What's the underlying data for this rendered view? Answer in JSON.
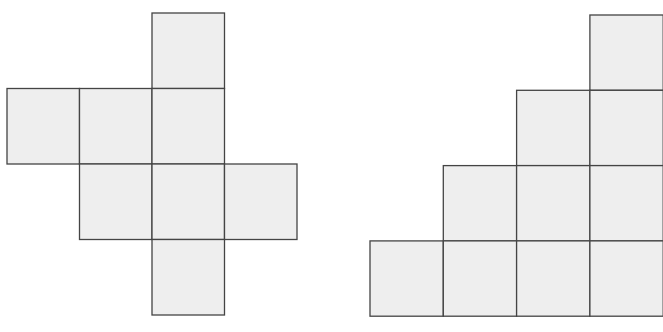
{
  "colors": {
    "cell_fill": "#eeeeee",
    "cell_stroke": "#444444",
    "background": "#ffffff"
  },
  "figures": [
    {
      "name": "cross-net-figure",
      "origin_x": 7,
      "origin_y": 13,
      "cell_w": 72.5,
      "cell_h": 75.5,
      "cells": [
        {
          "row": 0,
          "col": 2
        },
        {
          "row": 1,
          "col": 0
        },
        {
          "row": 1,
          "col": 1
        },
        {
          "row": 1,
          "col": 2
        },
        {
          "row": 2,
          "col": 1
        },
        {
          "row": 2,
          "col": 2
        },
        {
          "row": 2,
          "col": 3
        },
        {
          "row": 3,
          "col": 2
        }
      ]
    },
    {
      "name": "staircase-figure",
      "origin_x": 370,
      "origin_y": 15,
      "cell_w": 73.3,
      "cell_h": 75.3,
      "cells": [
        {
          "row": 0,
          "col": 3
        },
        {
          "row": 1,
          "col": 2
        },
        {
          "row": 1,
          "col": 3
        },
        {
          "row": 2,
          "col": 1
        },
        {
          "row": 2,
          "col": 2
        },
        {
          "row": 2,
          "col": 3
        },
        {
          "row": 3,
          "col": 0
        },
        {
          "row": 3,
          "col": 1
        },
        {
          "row": 3,
          "col": 2
        },
        {
          "row": 3,
          "col": 3
        }
      ]
    }
  ]
}
